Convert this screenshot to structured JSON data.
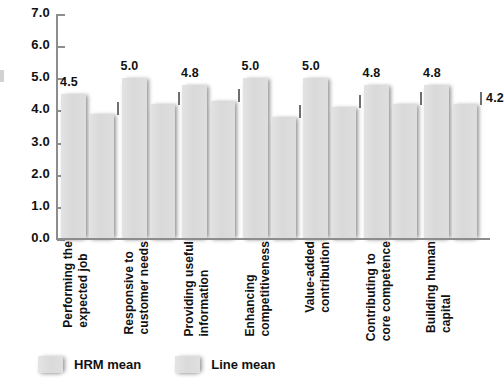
{
  "chart_data": {
    "type": "bar",
    "title": "",
    "subtitle": "",
    "xlabel": "",
    "ylabel": "",
    "ylim": [
      0.0,
      7.0
    ],
    "ytick_step": 1.0,
    "grid": false,
    "legend_position": "bottom-left",
    "yticks": [
      "7.0",
      "6.0",
      "5.0",
      "4.0",
      "3.0",
      "2.0",
      "1.0",
      "0.0"
    ],
    "categories": [
      "Performing the\nexpected job",
      "Responsive to\ncustomer needs",
      "Providing useful\ninformation",
      "Enhancing\ncompetitiveness",
      "Value-added\ncontribution",
      "Contributing to\ncore competence",
      "Building human\ncapital"
    ],
    "series": [
      {
        "name": "HRM mean",
        "color": "#dcdcdc",
        "values": [
          4.5,
          5.0,
          4.8,
          5.0,
          5.0,
          4.8,
          4.8
        ],
        "labels": [
          "4.5",
          "5.0",
          "4.8",
          "5.0",
          "5.0",
          "4.8",
          "4.8"
        ]
      },
      {
        "name": "Line mean",
        "color": "#dcdcdc",
        "values": [
          3.9,
          4.2,
          4.3,
          3.8,
          4.1,
          4.2,
          4.2
        ],
        "labels": [
          "3.9",
          "4.2",
          "4.3",
          "3.8",
          "4.1",
          "4.2",
          "4.2"
        ]
      }
    ]
  },
  "legend": {
    "items": [
      {
        "label": "HRM mean"
      },
      {
        "label": "Line mean"
      }
    ]
  }
}
